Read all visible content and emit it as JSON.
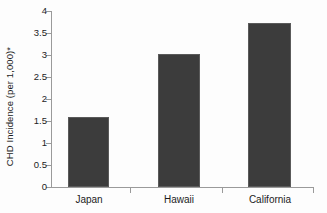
{
  "chart_data": {
    "type": "bar",
    "title": "",
    "subtitle": "",
    "xlabel": "",
    "ylabel": "CHD Incidence (per 1,000)*",
    "categories": [
      "Japan",
      "Hawaii",
      "California"
    ],
    "values": [
      1.6,
      3.02,
      3.72
    ],
    "series": [
      {
        "name": "CHD Incidence",
        "values": [
          1.6,
          3.02,
          3.72
        ]
      }
    ],
    "ylim": [
      0,
      4
    ],
    "xlim_note": "categorical",
    "ytick_labels": [
      "0",
      "0.5",
      "1",
      "1.5",
      "2",
      "2.5",
      "3",
      "3.5",
      "4"
    ],
    "ytick_values": [
      0,
      0.5,
      1,
      1.5,
      2,
      2.5,
      3,
      3.5,
      4
    ],
    "grid": false,
    "legend": false,
    "legend_position": "none",
    "bar_color": "#3c3c3c",
    "axis_color": "#9a9a9a",
    "text_color": "#1c1c1c",
    "background_color": "#fdfdfd",
    "annotations": [
      "* asterisk footnote marker in y-axis label"
    ]
  }
}
